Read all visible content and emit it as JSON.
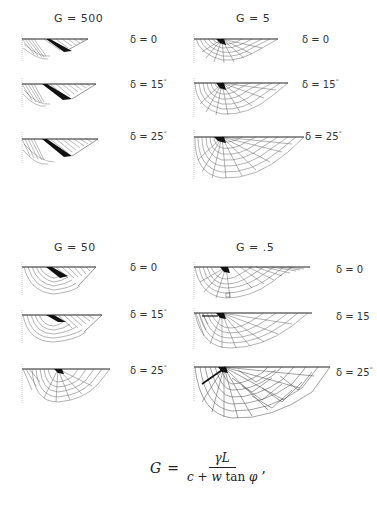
{
  "figure": {
    "panels": [
      {
        "id": "g500",
        "title": "G = 500",
        "rows": [
          {
            "delta_label": "δ = 0",
            "delta_value": 0
          },
          {
            "delta_label": "δ = 15",
            "delta_value": 15,
            "deg": "°"
          },
          {
            "delta_label": "δ = 25",
            "delta_value": 25,
            "deg": "°"
          }
        ]
      },
      {
        "id": "g5",
        "title": "G = 5",
        "rows": [
          {
            "delta_label": "δ = 0",
            "delta_value": 0
          },
          {
            "delta_label": "δ = 15",
            "delta_value": 15,
            "deg": "°"
          },
          {
            "delta_label": "δ = 25",
            "delta_value": 25,
            "deg": "°"
          }
        ]
      },
      {
        "id": "g50",
        "title": "G = 50",
        "rows": [
          {
            "delta_label": "δ = 0",
            "delta_value": 0
          },
          {
            "delta_label": "δ = 15",
            "delta_value": 15,
            "deg": "°"
          },
          {
            "delta_label": "δ = 25",
            "delta_value": 25,
            "deg": "°"
          }
        ]
      },
      {
        "id": "g05",
        "title": "G = .5",
        "rows": [
          {
            "delta_label": "δ = 0",
            "delta_value": 0
          },
          {
            "delta_label": "δ = 15",
            "delta_value": 15,
            "deg": ""
          },
          {
            "delta_label": "δ = 25",
            "delta_value": 25,
            "deg": "°"
          }
        ]
      }
    ],
    "equation": {
      "lhs": "G",
      "equals": "=",
      "numerator": "γL",
      "denominator_c": "c",
      "denominator_plus": "+",
      "denominator_w": "w",
      "denominator_tan": "tan",
      "denominator_phi": "φ",
      "trailing": ","
    }
  }
}
